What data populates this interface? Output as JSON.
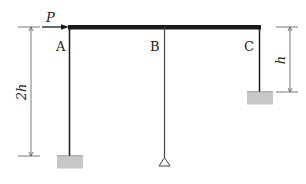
{
  "diagram": {
    "type": "frame-structure",
    "load": {
      "label": "P",
      "direction": "right"
    },
    "columns": [
      {
        "label": "A",
        "support": "fixed",
        "height": "2h"
      },
      {
        "label": "B",
        "support": "pinned"
      },
      {
        "label": "C",
        "support": "fixed",
        "height": "h"
      }
    ],
    "dimensions": {
      "left": "2h",
      "right": "h"
    },
    "colors": {
      "member": "#1a1a1a",
      "support_fill": "#c8c8c8",
      "dimension_line": "#555555"
    }
  }
}
